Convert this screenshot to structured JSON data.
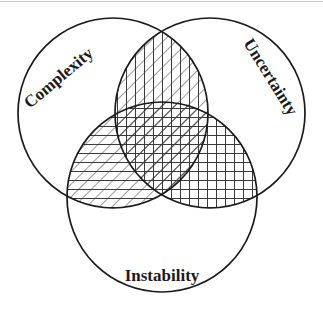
{
  "figure": {
    "type": "venn-diagram-3-set",
    "title": "",
    "background_color": "#ffffff",
    "stroke_color": "#1a1a1a",
    "hatch_color": "#3a3a3a",
    "width": 323,
    "height": 321
  },
  "sets": [
    {
      "id": "complexity",
      "label": "Complexity",
      "position": "top-left",
      "cx": 113,
      "cy": 113,
      "r": 95,
      "label_rotation_deg": -40,
      "label_x": 62,
      "label_y": 82,
      "font_size": 17
    },
    {
      "id": "uncertainty",
      "label": "Uncertainty",
      "position": "top-right",
      "cx": 210,
      "cy": 113,
      "r": 95,
      "label_rotation_deg": 58,
      "label_x": 243,
      "label_y": 43,
      "font_size": 17
    },
    {
      "id": "instability",
      "label": "Instability",
      "position": "bottom-center",
      "cx": 162,
      "cy": 197,
      "r": 95,
      "label_rotation_deg": 0,
      "label_x": 162,
      "label_y": 281,
      "font_size": 17
    }
  ],
  "regions": [
    {
      "id": "complexity-uncertainty",
      "name": "Complexity and Uncertainty overlap",
      "sets": [
        "complexity",
        "uncertainty"
      ],
      "fill": "diagonal-and-vertical-hatch",
      "shaded": true
    },
    {
      "id": "complexity-instability",
      "name": "Complexity and Instability overlap",
      "sets": [
        "complexity",
        "instability"
      ],
      "fill": "diagonal-and-horizontal-hatch",
      "shaded": true
    },
    {
      "id": "uncertainty-instability",
      "name": "Uncertainty and Instability overlap",
      "sets": [
        "uncertainty",
        "instability"
      ],
      "fill": "horizontal-and-vertical-grid",
      "shaded": true
    },
    {
      "id": "all-three",
      "name": "Complexity, Uncertainty and Instability overlap",
      "sets": [
        "complexity",
        "uncertainty",
        "instability"
      ],
      "fill": "diagonal-horizontal-and-vertical-hatch",
      "shaded": true
    }
  ],
  "hatching": {
    "diagonal_spacing": 9,
    "diagonal_angle_deg": 45,
    "horizontal_spacing": 9,
    "vertical_spacing": 9,
    "line_width": 1
  }
}
